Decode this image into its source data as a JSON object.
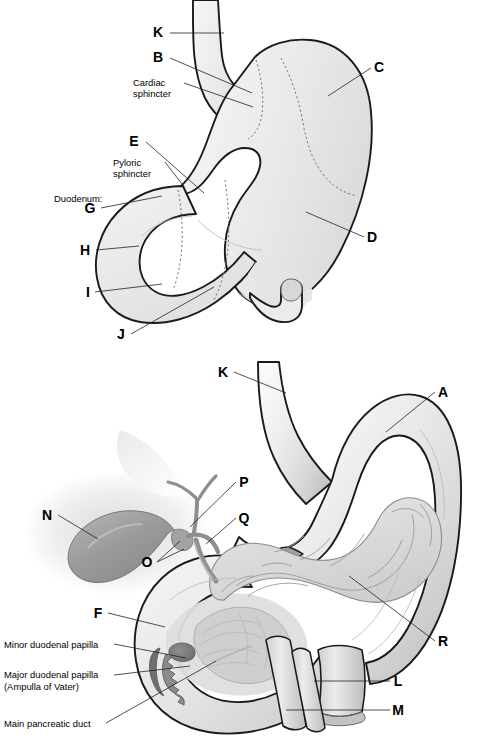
{
  "figure": {
    "background_color": "#ffffff",
    "outline_color": "#1a1a1a",
    "fill_light": "#eeeeee",
    "fill_mid": "#d8d8d8",
    "fill_dark": "#9a9a9a"
  },
  "panels": [
    {
      "id": "upper",
      "name": "stomach-duodenum-external-view",
      "labels": [
        {
          "key": "K",
          "text": "K",
          "type": "letter",
          "x": 158,
          "y": 37,
          "line": [
            [
              170,
              33
            ],
            [
              224,
              33
            ],
            [
              224,
              33
            ]
          ]
        },
        {
          "key": "B",
          "text": "B",
          "type": "letter",
          "x": 158,
          "y": 62,
          "line": [
            [
              170,
              58
            ],
            [
              252,
              93
            ]
          ]
        },
        {
          "key": "cardiac",
          "text": "Cardiac",
          "text2": "sphincter",
          "type": "text",
          "x": 133,
          "y": 86,
          "line": [
            [
              182,
              83
            ],
            [
              253,
              103
            ]
          ]
        },
        {
          "key": "C",
          "text": "C",
          "type": "letter",
          "x": 377,
          "y": 72,
          "line": [
            [
              371,
              68
            ],
            [
              330,
              95
            ]
          ]
        },
        {
          "key": "E",
          "text": "E",
          "type": "letter",
          "x": 134,
          "y": 146,
          "line": [
            [
              146,
              142
            ],
            [
              203,
              192
            ]
          ]
        },
        {
          "key": "pyloric",
          "text": "Pyloric",
          "text2": "sphincter",
          "type": "text",
          "x": 113,
          "y": 166,
          "line": [
            [
              163,
              163
            ],
            [
              181,
              183
            ]
          ]
        },
        {
          "key": "duodenum",
          "text": "Duodenum:",
          "type": "text",
          "x": 54,
          "y": 200,
          "line": null
        },
        {
          "key": "G",
          "text": "G",
          "type": "letter",
          "x": 89,
          "y": 212,
          "line": [
            [
              101,
              208
            ],
            [
              160,
              197
            ]
          ]
        },
        {
          "key": "H",
          "text": "H",
          "type": "letter",
          "x": 82,
          "y": 254,
          "line": [
            [
              95,
              250
            ],
            [
              137,
              246
            ]
          ]
        },
        {
          "key": "I",
          "text": "I",
          "type": "letter",
          "x": 86,
          "y": 296,
          "line": [
            [
              95,
              292
            ],
            [
              160,
              285
            ]
          ]
        },
        {
          "key": "J",
          "text": "J",
          "type": "letter",
          "x": 119,
          "y": 338,
          "line": [
            [
              131,
              334
            ],
            [
              213,
              288
            ]
          ]
        },
        {
          "key": "D",
          "text": "D",
          "type": "letter",
          "x": 370,
          "y": 241,
          "line": [
            [
              364,
              237
            ],
            [
              305,
              212
            ]
          ]
        }
      ]
    },
    {
      "id": "lower",
      "name": "stomach-pancreas-biliary-cutaway-view",
      "labels": [
        {
          "key": "K2",
          "text": "K",
          "type": "letter",
          "x": 222,
          "y": 376,
          "line": [
            [
              234,
              372
            ],
            [
              285,
              392
            ]
          ]
        },
        {
          "key": "A",
          "text": "A",
          "type": "letter",
          "x": 441,
          "y": 396,
          "line": [
            [
              435,
              392
            ],
            [
              385,
              432
            ]
          ]
        },
        {
          "key": "P",
          "text": "P",
          "type": "letter",
          "x": 242,
          "y": 486,
          "line": [
            [
              236,
              482
            ],
            [
              188,
              527
            ]
          ]
        },
        {
          "key": "N",
          "text": "N",
          "type": "letter",
          "x": 46,
          "y": 519,
          "line": [
            [
              58,
              515
            ],
            [
              96,
              538
            ]
          ]
        },
        {
          "key": "Q",
          "text": "Q",
          "type": "letter",
          "x": 242,
          "y": 522,
          "line": [
            [
              236,
              518
            ],
            [
              204,
              542
            ]
          ]
        },
        {
          "key": "O",
          "text": "O",
          "type": "letter",
          "x": 145,
          "y": 566,
          "line": [
            [
              157,
              562
            ],
            [
              178,
              542
            ]
          ]
        },
        {
          "key": "F",
          "text": "F",
          "type": "letter",
          "x": 96,
          "y": 617,
          "line": [
            [
              108,
              613
            ],
            [
              163,
              626
            ]
          ]
        },
        {
          "key": "R",
          "text": "R",
          "type": "letter",
          "x": 441,
          "y": 645,
          "line": [
            [
              435,
              641
            ],
            [
              348,
              575
            ]
          ]
        },
        {
          "key": "minor",
          "text": "Minor duodenal papilla",
          "type": "text",
          "x": 4,
          "y": 648,
          "line": [
            [
              114,
              644
            ],
            [
              182,
              658
            ]
          ]
        },
        {
          "key": "major",
          "text": "Major duodenal papilla",
          "text2": "(Ampulla of Vater)",
          "type": "text",
          "x": 4,
          "y": 678,
          "line": [
            [
              114,
              674
            ],
            [
              186,
              668
            ]
          ]
        },
        {
          "key": "L",
          "text": "L",
          "type": "letter",
          "x": 396,
          "y": 685,
          "line": [
            [
              390,
              681
            ],
            [
              316,
              681
            ]
          ]
        },
        {
          "key": "M",
          "text": "M",
          "type": "letter",
          "x": 396,
          "y": 714,
          "line": [
            [
              390,
              710
            ],
            [
              288,
              710
            ]
          ]
        },
        {
          "key": "mpd",
          "text": "Main pancreatic duct",
          "type": "text",
          "x": 4,
          "y": 727,
          "line": [
            [
              105,
              723
            ],
            [
              213,
              663
            ]
          ]
        }
      ]
    }
  ]
}
